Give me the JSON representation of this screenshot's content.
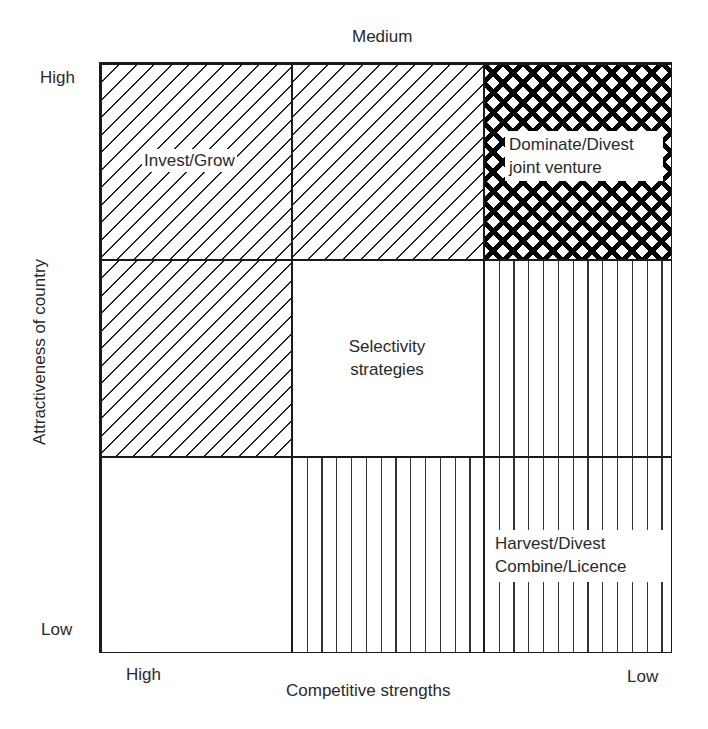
{
  "title_top": "Medium",
  "y_axis": {
    "label": "Attractiveness of country",
    "high": "High",
    "low": "Low"
  },
  "x_axis": {
    "label": "Competitive strengths",
    "high": "High",
    "low": "Low"
  },
  "cells": {
    "r0c0": {
      "pattern": "diagonal-hatch",
      "text": "Invest/Grow"
    },
    "r0c1": {
      "pattern": "diagonal-hatch",
      "text": ""
    },
    "r0c2": {
      "pattern": "cross-hatch",
      "line1": "Dominate/Divest",
      "line2": "joint venture"
    },
    "r1c0": {
      "pattern": "diagonal-hatch",
      "text": ""
    },
    "r1c1": {
      "pattern": "blank",
      "line1": "Selectivity",
      "line2": "strategies"
    },
    "r1c2": {
      "pattern": "vertical-hatch",
      "text": ""
    },
    "r2c0": {
      "pattern": "blank",
      "text": ""
    },
    "r2c1": {
      "pattern": "vertical-hatch",
      "text": ""
    },
    "r2c2": {
      "pattern": "vertical-hatch",
      "line1": "Harvest/Divest",
      "line2": "Combine/Licence"
    }
  },
  "colors": {
    "line": "#1a1a1a",
    "background": "#ffffff",
    "text": "#2a2a2a"
  }
}
